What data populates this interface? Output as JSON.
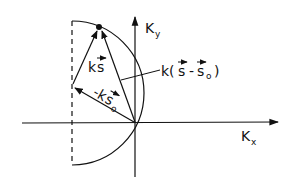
{
  "diagram": {
    "type": "ewald-sphere-construction",
    "colors": {
      "line": "#111111",
      "background": "#ffffff"
    },
    "axes": {
      "x": {
        "label": "K",
        "subscript": "x"
      },
      "y": {
        "label": "K",
        "subscript": "y"
      }
    },
    "vectors": [
      {
        "id": "ks",
        "label_main": "k",
        "label_vec": "s"
      },
      {
        "id": "minus-ks0",
        "label_main": "-k",
        "label_vec": "s",
        "label_sub": "o"
      },
      {
        "id": "k-s-minus-s0",
        "label_prefix": "k(",
        "label_vec1": "s",
        "label_minus": "-",
        "label_vec2": "s",
        "label_sub": "o",
        "label_suffix": ")"
      }
    ],
    "elements": {
      "circle_arc": "semicircle",
      "dashed_line": "vertical diameter",
      "point": "reciprocal lattice point"
    }
  }
}
